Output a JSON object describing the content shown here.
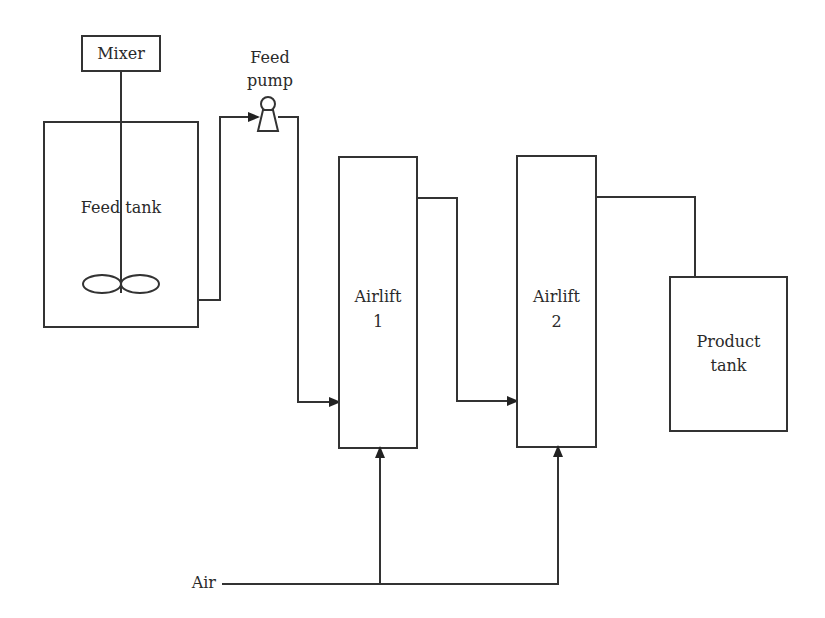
{
  "diagram": {
    "type": "process-flow",
    "components": {
      "mixer": {
        "label": "Mixer"
      },
      "feed_tank": {
        "label": "Feed tank"
      },
      "feed_pump": {
        "label_line1": "Feed",
        "label_line2": "pump"
      },
      "airlift_1": {
        "label_line1": "Airlift",
        "label_line2": "1"
      },
      "airlift_2": {
        "label_line1": "Airlift",
        "label_line2": "2"
      },
      "product_tank": {
        "label_line1": "Product",
        "label_line2": "tank"
      },
      "air_inlet": {
        "label": "Air"
      }
    },
    "flows": [
      {
        "from": "Feed tank",
        "to": "Feed pump"
      },
      {
        "from": "Feed pump",
        "to": "Airlift 1"
      },
      {
        "from": "Airlift 1",
        "to": "Airlift 2"
      },
      {
        "from": "Airlift 2",
        "to": "Product tank"
      },
      {
        "from": "Air",
        "to": "Airlift 1"
      },
      {
        "from": "Air",
        "to": "Airlift 2"
      }
    ],
    "colors": {
      "line": "#333333",
      "text": "#2a2a2a",
      "background": "#ffffff"
    }
  }
}
